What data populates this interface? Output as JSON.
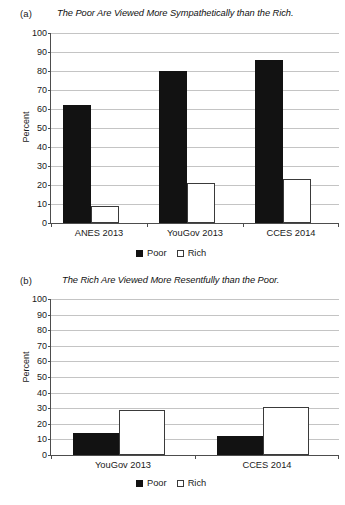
{
  "figure": {
    "panels": [
      {
        "tag": "(a)",
        "title": "The Poor Are Viewed More Sympathetically than the Rich.",
        "ylabel": "Percent"
      },
      {
        "tag": "(b)",
        "title": "The Rich Are Viewed More Resentfully than the Poor.",
        "ylabel": "Percent"
      }
    ],
    "legend": {
      "poor_label": "Poor",
      "rich_label": "Rich",
      "poor_color": "#121212",
      "rich_color": "#ffffff",
      "rich_border": "#3a3a3a"
    }
  },
  "chart_data": [
    {
      "type": "bar",
      "panel": "(a)",
      "title": "The Poor Are Viewed More Sympathetically than the Rich.",
      "xlabel": "",
      "ylabel": "Percent",
      "ylim": [
        0,
        100
      ],
      "yticks": [
        0,
        10,
        20,
        30,
        40,
        50,
        60,
        70,
        80,
        90,
        100
      ],
      "ytick_labels": [
        "0",
        "10",
        "20",
        "30",
        "40",
        "50",
        "60",
        "70",
        "80",
        "90",
        "100"
      ],
      "grid": true,
      "legend_position": "bottom-center",
      "categories": [
        "ANES 2013",
        "YouGov 2013",
        "CCES 2014"
      ],
      "series": [
        {
          "name": "Poor",
          "values": [
            62,
            80,
            86
          ]
        },
        {
          "name": "Rich",
          "values": [
            9,
            21,
            23
          ]
        }
      ]
    },
    {
      "type": "bar",
      "panel": "(b)",
      "title": "The Rich Are Viewed More Resentfully than the Poor.",
      "xlabel": "",
      "ylabel": "Percent",
      "ylim": [
        0,
        100
      ],
      "yticks": [
        0,
        10,
        20,
        30,
        40,
        50,
        60,
        70,
        80,
        90,
        100
      ],
      "ytick_labels": [
        "0",
        "10",
        "20",
        "30",
        "40",
        "50",
        "60",
        "70",
        "80",
        "90",
        "100"
      ],
      "grid": true,
      "legend_position": "bottom-center",
      "categories": [
        "YouGov 2013",
        "CCES 2014"
      ],
      "series": [
        {
          "name": "Poor",
          "values": [
            14,
            12
          ]
        },
        {
          "name": "Rich",
          "values": [
            29,
            31
          ]
        }
      ]
    }
  ]
}
